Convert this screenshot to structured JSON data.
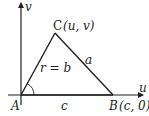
{
  "diagram": {
    "axes": {
      "x_label": "u",
      "y_label": "v"
    },
    "vertices": {
      "A": {
        "label": "A"
      },
      "B": {
        "label": "B",
        "coords": "(c, 0)"
      },
      "C": {
        "label": "C",
        "coords": "(u, v)"
      }
    },
    "sides": {
      "AB": "c",
      "BC": "a",
      "AC": "r = b"
    },
    "colors": {
      "stroke": "#231f20",
      "background": "#ffffff"
    }
  }
}
